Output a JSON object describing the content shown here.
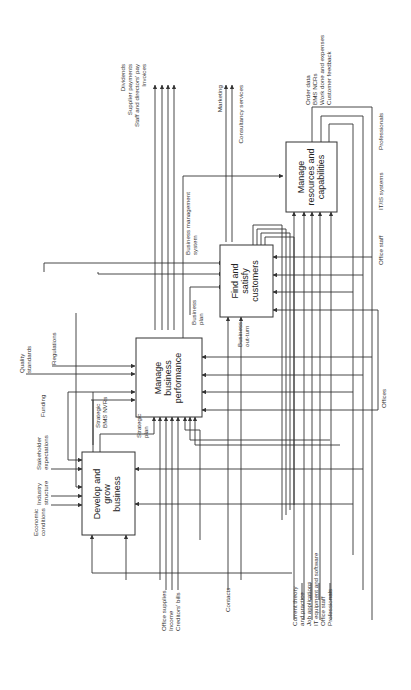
{
  "diagram": {
    "type": "IDEF0 process diagram (rotated 90°)",
    "boxes": [
      {
        "id": "develop",
        "lines": [
          "Develop and",
          "grow",
          "business"
        ]
      },
      {
        "id": "manage_perf",
        "lines": [
          "Manage",
          "business",
          "performance"
        ]
      },
      {
        "id": "find",
        "lines": [
          "Find and",
          "satisfy",
          "customers"
        ]
      },
      {
        "id": "resources",
        "lines": [
          "Manage",
          "resources and",
          "capabilities"
        ]
      }
    ],
    "controls_top": [
      {
        "lines": [
          "Economic",
          "conditions"
        ]
      },
      {
        "lines": [
          "Industry",
          "structure"
        ]
      },
      {
        "lines": [
          "Stakeholder",
          "expectations"
        ]
      },
      {
        "lines": [
          "Funding"
        ]
      },
      {
        "lines": [
          "Quality",
          "standards"
        ]
      },
      {
        "lines": [
          "Regulations"
        ]
      }
    ],
    "outputs_right": {
      "finance": [
        "Dividends",
        "Supplier payments",
        "Staff and directors' pay",
        "Invoices"
      ],
      "marketing": "Marketing",
      "consultancy": "Consultancy services",
      "resources_out": [
        "Order data",
        "BMS NCRs",
        "Work done and expenses",
        "Customer feedback"
      ]
    },
    "inner_labels": {
      "strategic_bms": [
        "Strategic",
        "BMS NVRs"
      ],
      "strategic_plan": [
        "Strategic",
        "plan"
      ],
      "business_plan": [
        "Business",
        "plan"
      ],
      "business_outturn": [
        "Business",
        "out-turn"
      ],
      "bms_system": [
        "Business management",
        "system"
      ]
    },
    "mechanisms": {
      "professionals": "Professionals",
      "itis": "IT/IS systems",
      "office_staff": "Office staff",
      "offices": "Offices"
    },
    "inputs_bottom": {
      "finance": [
        "Office supplies",
        "Income",
        "Creditors' bills"
      ],
      "contacts": "Contacts",
      "resources": [
        [
          "Current theory",
          "and practice"
        ],
        [
          "Job applications"
        ],
        [
          "IT equipment and software"
        ],
        [
          "Office staff"
        ],
        [
          "Professionals"
        ]
      ]
    }
  }
}
